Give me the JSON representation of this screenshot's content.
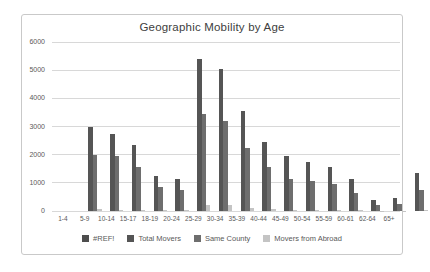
{
  "chart_data": {
    "type": "bar",
    "title": "Geographic Mobility by Age",
    "categories": [
      "1-4",
      "5-9",
      "10-14",
      "15-17",
      "18-19",
      "20-24",
      "25-29",
      "30-34",
      "35-39",
      "40-44",
      "45-49",
      "50-54",
      "55-59",
      "60-61",
      "62-64",
      "65+"
    ],
    "series": [
      {
        "name": "#REF!",
        "color": "#4d4d4d",
        "values": [
          0,
          0,
          0,
          0,
          0,
          0,
          0,
          0,
          0,
          0,
          0,
          0,
          0,
          0,
          0,
          0
        ]
      },
      {
        "name": "Total Movers",
        "color": "#555555",
        "values": [
          3000,
          2750,
          2350,
          1250,
          1150,
          5400,
          5050,
          3550,
          2450,
          1950,
          1750,
          1550,
          1150,
          380,
          460,
          1350
        ]
      },
      {
        "name": "Same County",
        "color": "#6e6e6e",
        "values": [
          2000,
          1950,
          1550,
          850,
          750,
          3450,
          3200,
          2250,
          1550,
          1150,
          1050,
          950,
          650,
          200,
          250,
          750
        ]
      },
      {
        "name": "Movers from Abroad",
        "color": "#c4c4c4",
        "values": [
          60,
          50,
          50,
          30,
          30,
          200,
          200,
          100,
          60,
          50,
          40,
          40,
          30,
          10,
          15,
          40
        ]
      }
    ],
    "xlabel": "",
    "ylabel": "",
    "ylim": [
      0,
      6000
    ],
    "yticks": [
      0,
      1000,
      2000,
      3000,
      4000,
      5000,
      6000
    ],
    "grid": true,
    "legend_position": "bottom"
  },
  "colors": {
    "grid": "#d8d8d8",
    "axis_text": "#595959",
    "title_text": "#404040",
    "frame_border": "#c9c9c9",
    "background": "#ffffff"
  }
}
